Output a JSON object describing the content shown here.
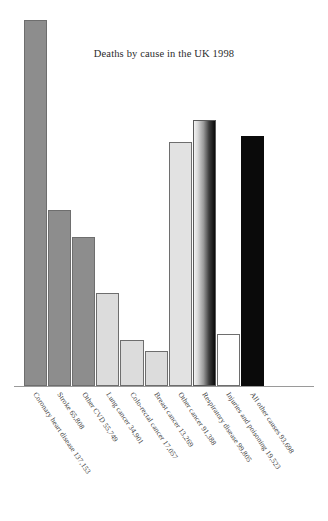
{
  "chart_data": {
    "type": "bar",
    "title": "Deaths by cause in the UK 1998",
    "xlabel": "",
    "ylabel": "",
    "ylim": [
      0,
      137153
    ],
    "grid": false,
    "legend": "none",
    "categories": [
      "Coronary heart disease 137,153",
      "Stroke 65,808",
      "Other CVD 55,749",
      "Lung cancer 34,901",
      "Colo-rectal cancer 17,057",
      "Breast cancer 13,269",
      "Other cancer 91,388",
      "Respiratory disease 99,805",
      "Injuries and poisoning 19,523",
      "All other causes 93,698"
    ],
    "values": [
      137153,
      65808,
      55749,
      34901,
      17057,
      13269,
      91388,
      99805,
      19523,
      93698
    ],
    "bar_fills": [
      "#8d8d8d",
      "#8d8d8d",
      "#8d8d8d",
      "#dcdcdc",
      "#dcdcdc",
      "#dcdcdc",
      "#e2e2e2",
      "gradient-light-to-black",
      "#ffffff",
      "#0a0a0a"
    ],
    "bar_edge": "#6e6e6e",
    "axis_color": "#9a9a9a",
    "background": "#ffffff"
  },
  "chart": {
    "title": "Deaths by cause in the UK 1998"
  },
  "bars": [
    {
      "label": "Coronary heart disease 137,153",
      "value": 137153
    },
    {
      "label": "Stroke 65,808",
      "value": 65808
    },
    {
      "label": "Other CVD 55,749",
      "value": 55749
    },
    {
      "label": "Lung cancer 34,901",
      "value": 34901
    },
    {
      "label": "Colo-rectal cancer 17,057",
      "value": 17057
    },
    {
      "label": "Breast cancer 13,269",
      "value": 13269
    },
    {
      "label": "Other cancer 91,388",
      "value": 91388
    },
    {
      "label": "Respiratory disease 99,805",
      "value": 99805
    },
    {
      "label": "Injuries and poisoning 19,523",
      "value": 19523
    },
    {
      "label": "All other causes 93,698",
      "value": 93698
    }
  ]
}
